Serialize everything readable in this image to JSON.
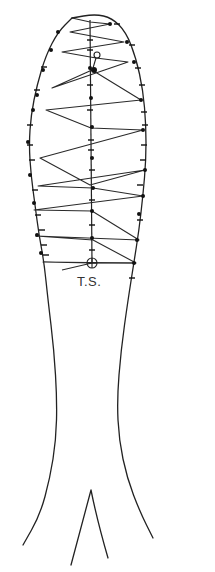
{
  "figure": {
    "type": "line-drawing",
    "label": "T.S.",
    "label_position": {
      "x": 77,
      "y": 274
    },
    "colors": {
      "stroke": "#222222",
      "background": "#ffffff"
    },
    "outline_left": [
      [
        72,
        18
      ],
      [
        58,
        32
      ],
      [
        46,
        55
      ],
      [
        37,
        85
      ],
      [
        31,
        115
      ],
      [
        29,
        145
      ],
      [
        31,
        175
      ],
      [
        35,
        205
      ],
      [
        39,
        235
      ],
      [
        44,
        262
      ],
      [
        48,
        300
      ],
      [
        54,
        350
      ],
      [
        57,
        400
      ],
      [
        56,
        440
      ],
      [
        50,
        478
      ],
      [
        40,
        515
      ],
      [
        23,
        545
      ]
    ],
    "outline_right": [
      [
        72,
        18
      ],
      [
        95,
        14
      ],
      [
        112,
        18
      ],
      [
        126,
        32
      ],
      [
        136,
        58
      ],
      [
        143,
        90
      ],
      [
        146,
        125
      ],
      [
        146,
        160
      ],
      [
        143,
        195
      ],
      [
        139,
        230
      ],
      [
        134,
        262
      ],
      [
        128,
        300
      ],
      [
        121,
        350
      ],
      [
        117,
        400
      ],
      [
        119,
        440
      ],
      [
        127,
        478
      ],
      [
        140,
        512
      ],
      [
        153,
        538
      ]
    ],
    "tail_fork": {
      "apex": [
        91,
        490
      ],
      "left": [
        71,
        565
      ],
      "right": [
        108,
        558
      ]
    },
    "midline": {
      "x": 90,
      "y_start": 20,
      "y_end": 263
    },
    "lattice_zigzag": [
      [
        72,
        18
      ],
      [
        90,
        22
      ],
      [
        110,
        24
      ],
      [
        70,
        32
      ],
      [
        124,
        42
      ],
      [
        62,
        52
      ],
      [
        96,
        58
      ],
      [
        128,
        62
      ],
      [
        52,
        88
      ],
      [
        92,
        70
      ],
      [
        141,
        100
      ],
      [
        46,
        110
      ],
      [
        91,
        128
      ],
      [
        143,
        130
      ],
      [
        40,
        158
      ],
      [
        90,
        185
      ],
      [
        145,
        170
      ],
      [
        38,
        186
      ],
      [
        93,
        188
      ],
      [
        143,
        196
      ],
      [
        34,
        210
      ],
      [
        92,
        211
      ],
      [
        139,
        240
      ],
      [
        36,
        236
      ],
      [
        93,
        240
      ],
      [
        136,
        263
      ],
      [
        43,
        262
      ],
      [
        92,
        263
      ]
    ],
    "left_nodes": [
      [
        58,
        32
      ],
      [
        51,
        50
      ],
      [
        43,
        70
      ],
      [
        37,
        95
      ],
      [
        33,
        110
      ],
      [
        28,
        142
      ],
      [
        30,
        175
      ],
      [
        34,
        203
      ],
      [
        37,
        235
      ],
      [
        41,
        253
      ]
    ],
    "mid_nodes": [
      [
        90,
        68
      ],
      [
        91,
        98
      ],
      [
        92,
        127
      ],
      [
        92,
        158
      ],
      [
        93,
        188
      ],
      [
        92,
        211
      ],
      [
        92,
        238
      ]
    ],
    "right_nodes": [
      [
        110,
        24
      ],
      [
        127,
        42
      ],
      [
        134,
        62
      ],
      [
        141,
        100
      ],
      [
        143,
        130
      ],
      [
        145,
        170
      ],
      [
        143,
        196
      ],
      [
        139,
        214
      ],
      [
        137,
        240
      ],
      [
        134,
        263
      ]
    ],
    "left_ticks": [
      [
        44,
        67
      ],
      [
        37,
        90
      ],
      [
        30,
        125
      ],
      [
        30,
        145
      ],
      [
        32,
        160
      ],
      [
        35,
        190
      ],
      [
        38,
        215
      ],
      [
        42,
        230
      ],
      [
        44,
        245
      ],
      [
        46,
        255
      ]
    ],
    "right_ticks": [
      [
        117,
        24
      ],
      [
        132,
        45
      ],
      [
        138,
        68
      ],
      [
        142,
        85
      ],
      [
        144,
        112
      ],
      [
        145,
        125
      ],
      [
        144,
        145
      ],
      [
        143,
        160
      ],
      [
        140,
        185
      ],
      [
        140,
        220
      ],
      [
        132,
        278
      ]
    ],
    "mid_ticks": [
      [
        90,
        40
      ],
      [
        90,
        50
      ],
      [
        90,
        85
      ],
      [
        90,
        110
      ],
      [
        91,
        140
      ],
      [
        91,
        150
      ],
      [
        92,
        170
      ],
      [
        92,
        200
      ],
      [
        92,
        225
      ],
      [
        92,
        250
      ]
    ],
    "markers": {
      "small_circle": {
        "cx": 97,
        "cy": 55,
        "r": 3
      },
      "cluster": {
        "cx": 94,
        "cy": 70,
        "r": 3
      },
      "ts_circle": {
        "cx": 92,
        "cy": 263,
        "r": 5
      }
    },
    "ts_crossline": [
      [
        62,
        270
      ],
      [
        92,
        263
      ],
      [
        136,
        263
      ]
    ]
  }
}
